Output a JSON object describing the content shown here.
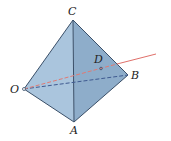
{
  "figure": {
    "type": "tetrahedron",
    "vertices": {
      "C": {
        "label": "C",
        "x": 73,
        "y": 20
      },
      "O": {
        "label": "O",
        "x": 24,
        "y": 89
      },
      "B": {
        "label": "B",
        "x": 128,
        "y": 75
      },
      "A": {
        "label": "A",
        "x": 74,
        "y": 122
      }
    },
    "point_D": {
      "label": "D",
      "x": 101,
      "y": 69
    },
    "ray": {
      "from": "O",
      "through": "D",
      "color": "#e0706a"
    },
    "colors": {
      "face_left": "#a9c4dc",
      "face_right": "#8faecb",
      "edge": "#3a4f68",
      "hidden_edge": "#3f5a90"
    }
  }
}
